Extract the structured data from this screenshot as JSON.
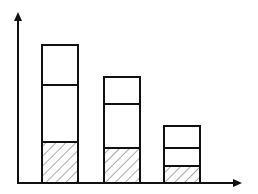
{
  "colors": {
    "line": "#111111",
    "background": "#ffffff",
    "hatch": "#333333"
  },
  "chart_data": {
    "type": "bar",
    "stacked": true,
    "title": "",
    "xlabel": "",
    "ylabel": "",
    "categories": [
      "",
      "",
      ""
    ],
    "series": [
      {
        "name": "bottom (hatched)",
        "pattern": "diagonal-hatch",
        "values": [
          41,
          35,
          17
        ]
      },
      {
        "name": "middle",
        "pattern": "none",
        "values": [
          57,
          44,
          18
        ]
      },
      {
        "name": "top",
        "pattern": "none",
        "values": [
          40,
          27,
          22
        ]
      }
    ],
    "totals": [
      138,
      106,
      57
    ],
    "units": "px (no tick labels shown)",
    "ylim": [
      0,
      170
    ],
    "grid": false,
    "legend": null,
    "axes": {
      "x_arrow": true,
      "y_arrow": true
    }
  },
  "geometry": {
    "origin_x": 18,
    "baseline_y": 183,
    "y_axis_top": 12,
    "x_axis_right": 242,
    "bar_lefts": [
      42,
      104,
      164
    ],
    "bar_width": 36
  }
}
